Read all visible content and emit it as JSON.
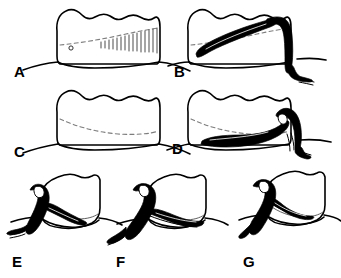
{
  "figure": {
    "type": "line-art-illustration",
    "background_color": "#ffffff",
    "ink_color": "#000000",
    "dashed_line_color": "#7d7d7d",
    "width": 341,
    "height": 278,
    "panel_count": 7
  },
  "panels": [
    {
      "id": "A",
      "label": "A",
      "label_x": 14,
      "label_y": 77,
      "description": "Tooth with gingiva showing subgingival calculus hatching and a small pocket marker dot",
      "features": [
        "tooth-crown-outline",
        "root-outline",
        "gum-line",
        "dashed-cej-line",
        "calculus-hatching",
        "pocket-dot"
      ],
      "instrument_present": false
    },
    {
      "id": "B",
      "label": "B",
      "label_x": 174,
      "label_y": 77,
      "description": "Same tooth with curette blade inserted under the gingiva reaching the calculus",
      "features": [
        "tooth-crown-outline",
        "gum-line",
        "dashed-cej-line",
        "curette-blade",
        "curette-shank"
      ],
      "instrument_present": true
    },
    {
      "id": "C",
      "label": "C",
      "label_x": 14,
      "label_y": 157,
      "description": "Tooth with gingiva, dashed cementoenamel junction, no instrument",
      "features": [
        "tooth-crown-outline",
        "gum-line",
        "dashed-cej-line"
      ],
      "instrument_present": false
    },
    {
      "id": "D",
      "label": "D",
      "label_x": 172,
      "label_y": 154,
      "description": "Tooth with curette blade swept horizontally along the root surface",
      "features": [
        "tooth-crown-outline",
        "gum-line",
        "dashed-cej-line",
        "curette-blade",
        "curette-shank"
      ],
      "instrument_present": true
    },
    {
      "id": "E",
      "label": "E",
      "label_x": 12,
      "label_y": 267,
      "description": "Angled proximal view with curette blade engaging the mesial surface",
      "features": [
        "tooth-crown-outline",
        "gum-line",
        "curette-blade",
        "curette-shank",
        "curette-handle"
      ],
      "instrument_present": true
    },
    {
      "id": "F",
      "label": "F",
      "label_x": 116,
      "label_y": 267,
      "description": "Angled proximal view with curette blade advanced further along the root",
      "features": [
        "tooth-crown-outline",
        "gum-line",
        "curette-blade",
        "curette-shank",
        "curette-handle"
      ],
      "instrument_present": true
    },
    {
      "id": "G",
      "label": "G",
      "label_x": 243,
      "label_y": 267,
      "description": "Angled proximal view with curette blade completing the stroke across the root",
      "features": [
        "tooth-crown-outline",
        "gum-line",
        "curette-blade",
        "curette-shank",
        "curette-handle"
      ],
      "instrument_present": true
    }
  ],
  "calculus_hatching": {
    "line_count": 15,
    "color": "#2a2a2a",
    "description": "Short vertical strokes of increasing length representing subgingival calculus deposit"
  }
}
